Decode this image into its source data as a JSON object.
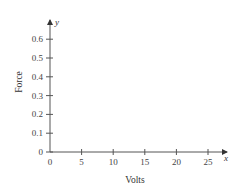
{
  "chart_data": {
    "type": "line",
    "title": "",
    "xlabel": "Volts",
    "ylabel": "Force",
    "x_axis_variable": "x",
    "y_axis_variable": "y",
    "x_ticks": [
      0,
      5,
      10,
      15,
      20,
      25
    ],
    "y_ticks": [
      0,
      0.1,
      0.2,
      0.3,
      0.4,
      0.5,
      0.6
    ],
    "x_tick_labels": [
      "0",
      "5",
      "10",
      "15",
      "20",
      "25"
    ],
    "y_tick_labels": [
      "0",
      "0.1",
      "0.2",
      "0.3",
      "0.4",
      "0.5",
      "0.6"
    ],
    "xlim": [
      0,
      28
    ],
    "ylim": [
      0,
      0.7
    ],
    "grid": false,
    "legend": null,
    "series": []
  },
  "colors": {
    "axis": "#555555",
    "text": "#333333",
    "background": "#ffffff"
  }
}
